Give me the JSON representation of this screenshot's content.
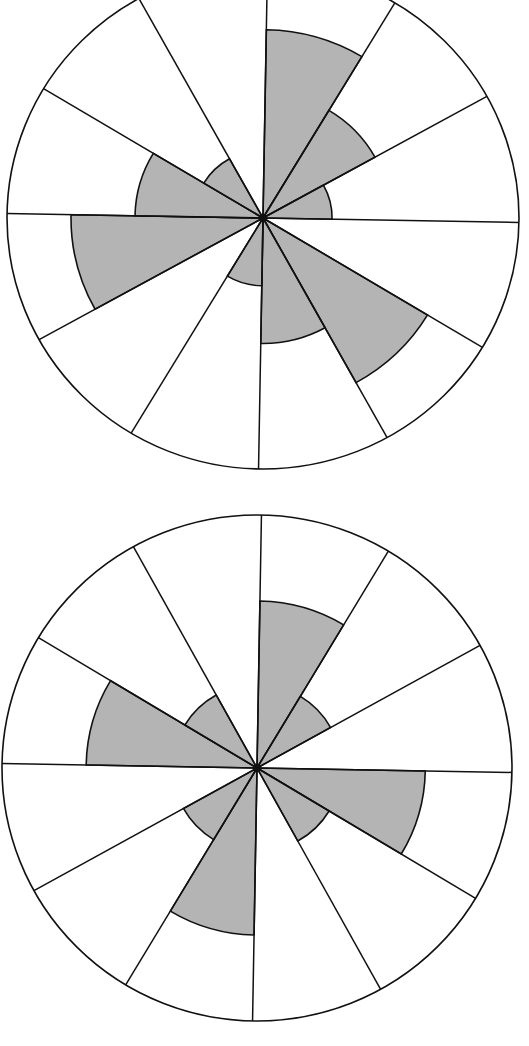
{
  "colors": {
    "background": "#ffffff",
    "line": "#111111",
    "fill": "#b4b4b4"
  },
  "chart_data": [
    {
      "type": "rose",
      "name": "upper-rose-diagram",
      "center": [
        263,
        218
      ],
      "radius_x": 256,
      "radius_y": 251,
      "rotation_deg": 1,
      "sector_count": 12,
      "sector_width_deg": 30,
      "sectors": [
        {
          "start": 0,
          "end": 30,
          "value": 0.75
        },
        {
          "start": 30,
          "end": 60,
          "value": 0.5
        },
        {
          "start": 60,
          "end": 90,
          "value": 0.27
        },
        {
          "start": 90,
          "end": 120,
          "value": 0
        },
        {
          "start": 120,
          "end": 150,
          "value": 0.75
        },
        {
          "start": 150,
          "end": 180,
          "value": 0.5
        },
        {
          "start": 180,
          "end": 210,
          "value": 0.27
        },
        {
          "start": 210,
          "end": 240,
          "value": 0
        },
        {
          "start": 240,
          "end": 270,
          "value": 0.75
        },
        {
          "start": 270,
          "end": 300,
          "value": 0.5
        },
        {
          "start": 300,
          "end": 330,
          "value": 0.27
        },
        {
          "start": 330,
          "end": 360,
          "value": 0
        }
      ]
    },
    {
      "type": "rose",
      "name": "lower-rose-diagram",
      "center": [
        257,
        768
      ],
      "radius_x": 255,
      "radius_y": 253,
      "rotation_deg": 1,
      "sector_count": 12,
      "sector_width_deg": 30,
      "sectors": [
        {
          "start": 0,
          "end": 30,
          "value": 0.66
        },
        {
          "start": 30,
          "end": 60,
          "value": 0.33
        },
        {
          "start": 60,
          "end": 90,
          "value": 0
        },
        {
          "start": 90,
          "end": 120,
          "value": 0.66
        },
        {
          "start": 120,
          "end": 150,
          "value": 0.33
        },
        {
          "start": 150,
          "end": 180,
          "value": 0
        },
        {
          "start": 180,
          "end": 210,
          "value": 0.66
        },
        {
          "start": 210,
          "end": 240,
          "value": 0.33
        },
        {
          "start": 240,
          "end": 270,
          "value": 0
        },
        {
          "start": 270,
          "end": 300,
          "value": 0.67
        },
        {
          "start": 300,
          "end": 330,
          "value": 0.33
        },
        {
          "start": 330,
          "end": 360,
          "value": 0
        }
      ]
    }
  ]
}
